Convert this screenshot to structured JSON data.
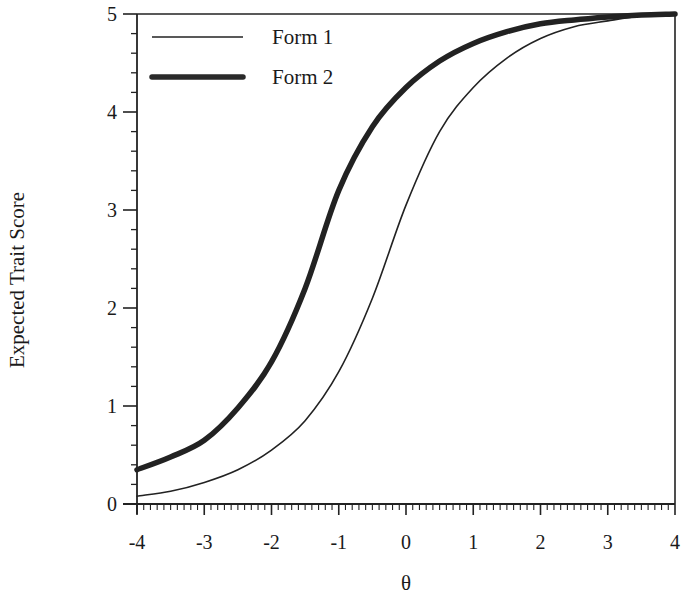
{
  "chart_data": {
    "type": "line",
    "title": "",
    "xlabel": "θ",
    "ylabel": "Expected Trait Score",
    "xlim": [
      -4,
      4
    ],
    "ylim": [
      0,
      5
    ],
    "x_ticks": [
      "-4",
      "-3",
      "-2",
      "-1",
      "0",
      "1",
      "2",
      "3",
      "4"
    ],
    "y_ticks": [
      "0",
      "1",
      "2",
      "3",
      "4",
      "5"
    ],
    "grid": false,
    "legend_position": "upper left",
    "x": [
      -4,
      -3.5,
      -3,
      -2.5,
      -2,
      -1.5,
      -1,
      -0.5,
      0,
      0.5,
      1,
      1.5,
      2,
      2.5,
      3,
      3.5,
      4
    ],
    "series": [
      {
        "name": "Form 1",
        "style": "thin",
        "color": "#222222",
        "values": [
          0.08,
          0.13,
          0.22,
          0.35,
          0.55,
          0.85,
          1.35,
          2.1,
          3.05,
          3.8,
          4.25,
          4.55,
          4.75,
          4.87,
          4.93,
          4.98,
          5.0
        ]
      },
      {
        "name": "Form 2",
        "style": "thick",
        "color": "#222222",
        "values": [
          0.35,
          0.48,
          0.65,
          0.98,
          1.45,
          2.2,
          3.2,
          3.85,
          4.25,
          4.52,
          4.7,
          4.82,
          4.9,
          4.94,
          4.97,
          4.99,
          5.0
        ]
      }
    ]
  },
  "legend": {
    "items": [
      {
        "label": "Form 1"
      },
      {
        "label": "Form 2"
      }
    ]
  },
  "axes": {
    "x_title": "θ",
    "y_title": "Expected Trait Score"
  }
}
